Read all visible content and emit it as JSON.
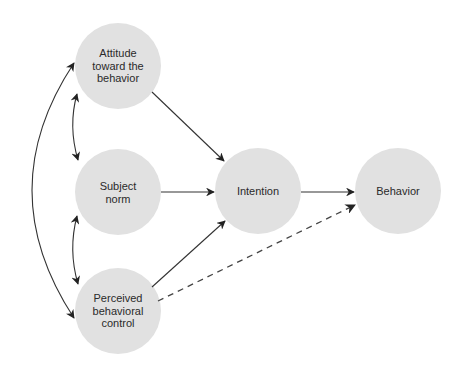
{
  "diagram": {
    "type": "path-diagram",
    "colors": {
      "node_fill": "#e1e1e1",
      "edge": "#333333"
    },
    "nodes": [
      {
        "id": "attitude",
        "lines": [
          "Attitude",
          "toward the",
          "behavior"
        ],
        "cx": 118,
        "cy": 66,
        "r": 43
      },
      {
        "id": "subject_norm",
        "lines": [
          "Subject",
          "norm"
        ],
        "cx": 118,
        "cy": 192,
        "r": 43
      },
      {
        "id": "pbc",
        "lines": [
          "Perceived",
          "behavioral",
          "control"
        ],
        "cx": 118,
        "cy": 311,
        "r": 43
      },
      {
        "id": "intention",
        "lines": [
          "Intention"
        ],
        "cx": 258,
        "cy": 191,
        "r": 43
      },
      {
        "id": "behavior",
        "lines": [
          "Behavior"
        ],
        "cx": 398,
        "cy": 191,
        "r": 43
      }
    ],
    "edges": [
      {
        "from": "attitude",
        "to": "intention",
        "style": "solid",
        "direction": "forward"
      },
      {
        "from": "subject_norm",
        "to": "intention",
        "style": "solid",
        "direction": "forward"
      },
      {
        "from": "pbc",
        "to": "intention",
        "style": "solid",
        "direction": "forward"
      },
      {
        "from": "intention",
        "to": "behavior",
        "style": "solid",
        "direction": "forward"
      },
      {
        "from": "pbc",
        "to": "behavior",
        "style": "dashed",
        "direction": "forward"
      },
      {
        "from": "attitude",
        "to": "subject_norm",
        "style": "solid-curved",
        "direction": "bidirectional"
      },
      {
        "from": "subject_norm",
        "to": "pbc",
        "style": "solid-curved",
        "direction": "bidirectional"
      },
      {
        "from": "attitude",
        "to": "pbc",
        "style": "solid-curved",
        "direction": "bidirectional"
      }
    ]
  }
}
